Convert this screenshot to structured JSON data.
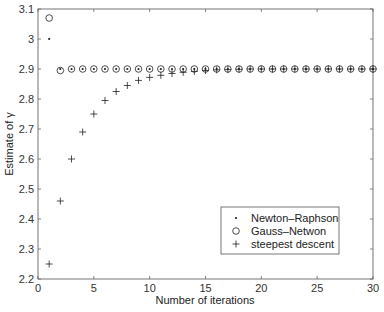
{
  "chart_data": {
    "type": "scatter",
    "title": "",
    "xlabel": "Number of iterations",
    "ylabel": "Estimate of γ",
    "xlim": [
      0,
      30
    ],
    "ylim": [
      2.2,
      3.1
    ],
    "xticks": [
      0,
      5,
      10,
      15,
      20,
      25,
      30
    ],
    "yticks": [
      2.2,
      2.3,
      2.4,
      2.5,
      2.6,
      2.7,
      2.8,
      2.9,
      3.0,
      3.1
    ],
    "xtick_labels": [
      "0",
      "5",
      "10",
      "15",
      "20",
      "25",
      "30"
    ],
    "ytick_labels": [
      "2.2",
      "2.3",
      "2.4",
      "2.5",
      "2.6",
      "2.7",
      "2.8",
      "2.9",
      "3",
      "3.1"
    ],
    "grid": false,
    "legend_position": "lower right",
    "series": [
      {
        "name": "Newton–Raphson",
        "marker": "dot",
        "x": [
          1,
          2,
          3,
          4,
          5,
          6,
          7,
          8,
          9,
          10,
          11,
          12,
          13,
          14,
          15,
          16,
          17,
          18,
          19,
          20,
          21,
          22,
          23,
          24,
          25,
          26,
          27,
          28,
          29,
          30
        ],
        "values": [
          3.0,
          2.9,
          2.9,
          2.9,
          2.9,
          2.9,
          2.9,
          2.9,
          2.9,
          2.9,
          2.9,
          2.9,
          2.9,
          2.9,
          2.9,
          2.9,
          2.9,
          2.9,
          2.9,
          2.9,
          2.9,
          2.9,
          2.9,
          2.9,
          2.9,
          2.9,
          2.9,
          2.9,
          2.9,
          2.9
        ]
      },
      {
        "name": "Gauss–Netwon",
        "marker": "circle",
        "x": [
          1,
          2,
          3,
          4,
          5,
          6,
          7,
          8,
          9,
          10,
          11,
          12,
          13,
          14,
          15,
          16,
          17,
          18,
          19,
          20,
          21,
          22,
          23,
          24,
          25,
          26,
          27,
          28,
          29,
          30
        ],
        "values": [
          3.07,
          2.895,
          2.9,
          2.9,
          2.9,
          2.9,
          2.9,
          2.9,
          2.9,
          2.9,
          2.9,
          2.9,
          2.9,
          2.9,
          2.9,
          2.9,
          2.9,
          2.9,
          2.9,
          2.9,
          2.9,
          2.9,
          2.9,
          2.9,
          2.9,
          2.9,
          2.9,
          2.9,
          2.9,
          2.9
        ]
      },
      {
        "name": "steepest descent",
        "marker": "plus",
        "x": [
          1,
          2,
          3,
          4,
          5,
          6,
          7,
          8,
          9,
          10,
          11,
          12,
          13,
          14,
          15,
          16,
          17,
          18,
          19,
          20,
          21,
          22,
          23,
          24,
          25,
          26,
          27,
          28,
          29,
          30
        ],
        "values": [
          2.25,
          2.46,
          2.6,
          2.69,
          2.75,
          2.795,
          2.825,
          2.845,
          2.862,
          2.872,
          2.879,
          2.885,
          2.889,
          2.892,
          2.895,
          2.897,
          2.898,
          2.899,
          2.9,
          2.9,
          2.9,
          2.9,
          2.9,
          2.9,
          2.9,
          2.9,
          2.9,
          2.9,
          2.9,
          2.9
        ]
      }
    ]
  },
  "legend": {
    "items": [
      {
        "label": "Newton–Raphson",
        "marker": "dot"
      },
      {
        "label": "Gauss–Netwon",
        "marker": "circle"
      },
      {
        "label": "steepest descent",
        "marker": "plus"
      }
    ]
  },
  "axes": {
    "xlabel": "Number of iterations",
    "ylabel": "Estimate of γ"
  }
}
